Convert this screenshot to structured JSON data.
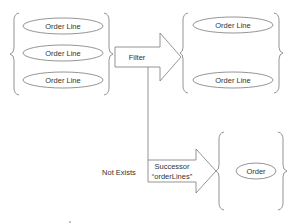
{
  "diagram": {
    "type": "flow",
    "colors": {
      "stroke": "#7a7a7a",
      "text": "#333333",
      "background": "#ffffff"
    },
    "source_group": {
      "items": [
        {
          "label": "Order Line"
        },
        {
          "label": "Order Line"
        },
        {
          "label": "Order Line"
        }
      ]
    },
    "filter_arrow": {
      "label": "Filter"
    },
    "result_group": {
      "items": [
        {
          "label": "Order Line"
        },
        {
          "label": "Order Line"
        }
      ]
    },
    "successor_arrow": {
      "label_line1": "Successor",
      "label_line2": "“orderLines”"
    },
    "condition": {
      "label": "Not Exists"
    },
    "target_group": {
      "items": [
        {
          "label": "Order"
        }
      ]
    }
  }
}
